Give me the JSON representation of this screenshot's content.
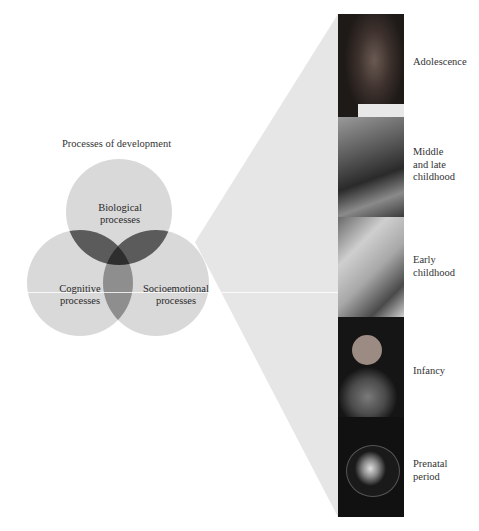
{
  "diagram": {
    "title": "Processes of development",
    "circles": [
      {
        "id": "biological",
        "line1": "Biological",
        "line2": "processes"
      },
      {
        "id": "cognitive",
        "line1": "Cognitive",
        "line2": "processes"
      },
      {
        "id": "socioemotional",
        "line1": "Socioemotional",
        "line2": "processes"
      }
    ],
    "periods": [
      {
        "id": "adolescence",
        "lines": [
          "Adolescence"
        ]
      },
      {
        "id": "middle-late-childhood",
        "lines": [
          "Middle",
          "and late",
          "childhood"
        ]
      },
      {
        "id": "early-childhood",
        "lines": [
          "Early",
          "childhood"
        ]
      },
      {
        "id": "infancy",
        "lines": [
          "Infancy"
        ]
      },
      {
        "id": "prenatal",
        "lines": [
          "Prenatal",
          "period"
        ]
      }
    ],
    "colors": {
      "wedge": "#e4e4e4",
      "circle": "#d6d6d6",
      "overlap_bio_cog": "#5a5a5a",
      "overlap_bio_socio": "#5a5a5a",
      "overlap_cog_socio": "#8c8c8c",
      "overlap_all": "#303030"
    }
  }
}
